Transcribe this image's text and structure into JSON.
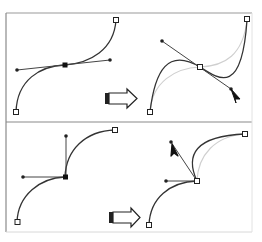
{
  "figure": {
    "colors": {
      "frame": "#8a8a8a",
      "curve": "#333333",
      "ghost_curve": "#cfcfcf",
      "handle_line": "#444444",
      "arrow_fill": "#ffffff",
      "arrow_stroke": "#222222"
    },
    "panels": [
      {
        "id": "top-before",
        "label": "Smooth anchor point with collinear direction handles"
      },
      {
        "id": "top-after",
        "label": "Dragging handle rotates both handles together"
      },
      {
        "id": "bottom-before",
        "label": "Corner anchor point with independent handles"
      },
      {
        "id": "bottom-after",
        "label": "Dragging one handle affects only its segment"
      }
    ],
    "arrows": [
      {
        "id": "top-arrow",
        "direction": "right"
      },
      {
        "id": "bottom-arrow",
        "direction": "right"
      }
    ]
  }
}
